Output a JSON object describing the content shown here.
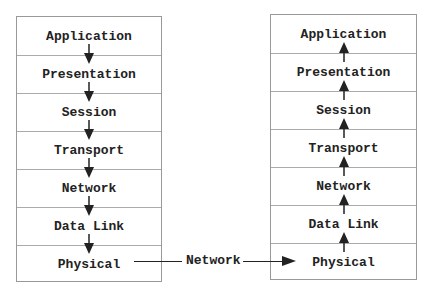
{
  "left_stack": {
    "direction": "down",
    "layers": [
      "Application",
      "Presentation",
      "Session",
      "Transport",
      "Network",
      "Data Link",
      "Physical"
    ]
  },
  "right_stack": {
    "direction": "up",
    "layers": [
      "Application",
      "Presentation",
      "Session",
      "Transport",
      "Network",
      "Data Link",
      "Physical"
    ]
  },
  "connection": {
    "label": "Network",
    "from": "left Physical",
    "to": "right Physical"
  }
}
